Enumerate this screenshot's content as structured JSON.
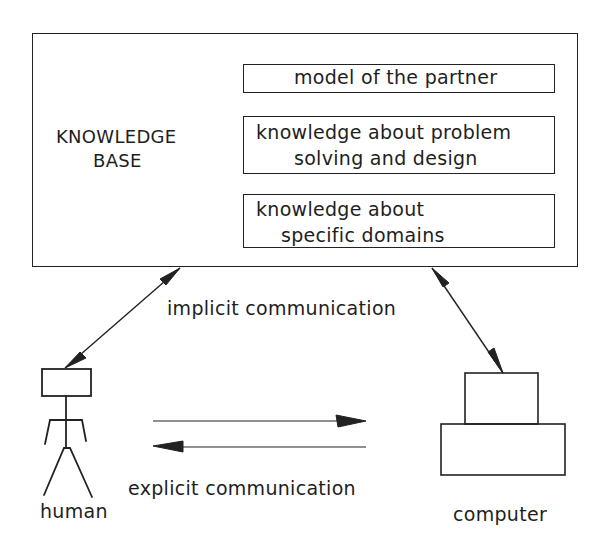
{
  "knowledge_base": {
    "title_line1": "KNOWLEDGE",
    "title_line2": "BASE",
    "components": [
      {
        "line1": "model of the partner",
        "line2": ""
      },
      {
        "line1": "knowledge about problem",
        "line2": "solving and design"
      },
      {
        "line1": "knowledge about",
        "line2": "specific domains"
      }
    ]
  },
  "labels": {
    "implicit": "implicit communication",
    "explicit": "explicit communication",
    "human": "human",
    "computer": "computer"
  },
  "colors": {
    "line": "#222222",
    "background": "#ffffff"
  }
}
